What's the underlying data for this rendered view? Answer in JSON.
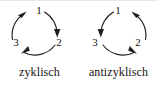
{
  "figure": {
    "stroke_color": "#231f1c",
    "text_color": "#16120f",
    "background_color": "#ffffff"
  },
  "diagrams": [
    {
      "id": "zyklisch",
      "caption": "zyklisch",
      "direction": "clockwise",
      "nodes": [
        {
          "position": "top",
          "label": "1"
        },
        {
          "position": "right",
          "label": "2"
        },
        {
          "position": "left",
          "label": "3"
        }
      ],
      "arrows": [
        {
          "from": "3",
          "to": "1",
          "arrowhead_points": "up-right"
        },
        {
          "from": "1",
          "to": "2",
          "arrowhead_points": "down"
        },
        {
          "from": "2",
          "to": "3",
          "arrowhead_points": "left"
        }
      ]
    },
    {
      "id": "antizyklisch",
      "caption": "antizyklisch",
      "direction": "counterclockwise",
      "nodes": [
        {
          "position": "top",
          "label": "1"
        },
        {
          "position": "right",
          "label": "2"
        },
        {
          "position": "left",
          "label": "3"
        }
      ],
      "arrows": [
        {
          "from": "2",
          "to": "1",
          "arrowhead_points": "up-left"
        },
        {
          "from": "1",
          "to": "3",
          "arrowhead_points": "down"
        },
        {
          "from": "3",
          "to": "2",
          "arrowhead_points": "right"
        }
      ]
    }
  ]
}
